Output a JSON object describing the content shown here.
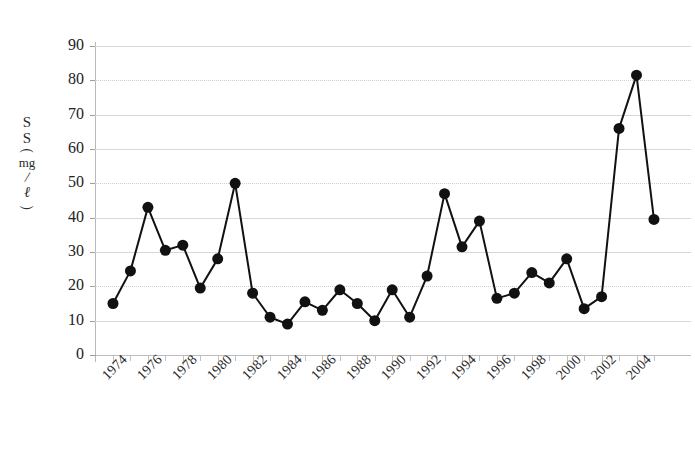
{
  "chart_data": {
    "type": "line",
    "title": "",
    "xlabel": "",
    "ylabel": "SS (mg/ℓ)",
    "ylabel_glyphs": [
      "S",
      "S",
      "(",
      "mg",
      "/",
      "ℓ",
      ")"
    ],
    "ylim": [
      0,
      90
    ],
    "ytick_values": [
      0,
      10,
      20,
      30,
      40,
      50,
      60,
      70,
      80,
      90
    ],
    "ytick_labels": [
      "0",
      "10",
      "20",
      "30",
      "40",
      "50",
      "60",
      "70",
      "80",
      "90"
    ],
    "xlim": [
      1974,
      2005
    ],
    "xtick_labels": [
      "1974",
      "1976",
      "1978",
      "1980",
      "1982",
      "1984",
      "1986",
      "1988",
      "1990",
      "1992",
      "1994",
      "1996",
      "1998",
      "2000",
      "2002",
      "2004"
    ],
    "xtick_label_years": [
      1974,
      1976,
      1978,
      1980,
      1982,
      1984,
      1986,
      1988,
      1990,
      1992,
      1994,
      1996,
      1998,
      2000,
      2002,
      2004
    ],
    "x": [
      1974,
      1975,
      1976,
      1977,
      1978,
      1979,
      1980,
      1981,
      1982,
      1983,
      1984,
      1985,
      1986,
      1987,
      1988,
      1989,
      1990,
      1991,
      1992,
      1993,
      1994,
      1995,
      1996,
      1997,
      1998,
      1999,
      2000,
      2001,
      2002,
      2003,
      2004,
      2005
    ],
    "values": [
      15,
      24.5,
      43,
      30.5,
      32,
      19.5,
      28,
      50,
      18,
      11,
      9,
      15.5,
      13,
      19,
      15,
      10,
      19,
      11,
      23,
      47,
      31.5,
      39,
      16.5,
      18,
      24,
      21,
      28,
      13.5,
      17,
      66,
      81.5,
      39.5
    ],
    "grid": {
      "horizontal": true,
      "vertical": false,
      "color": "#d8d8d8"
    },
    "legend": {
      "visible": false
    },
    "series_style": {
      "marker": "circle",
      "marker_size": 11,
      "line_width": 2,
      "color": "#111111"
    }
  }
}
